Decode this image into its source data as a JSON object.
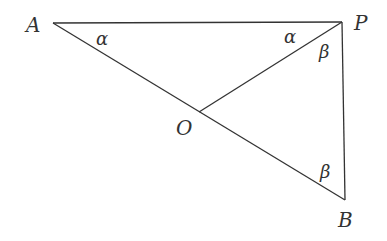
{
  "diagram": {
    "points": {
      "A": {
        "label": "A",
        "x": 53,
        "y": 23
      },
      "P": {
        "label": "P",
        "x": 342,
        "y": 22
      },
      "O": {
        "label": "O",
        "x": 199,
        "y": 112
      },
      "B": {
        "label": "B",
        "x": 345,
        "y": 200
      }
    },
    "segments": [
      {
        "from": "A",
        "to": "P"
      },
      {
        "from": "A",
        "to": "B"
      },
      {
        "from": "P",
        "to": "B"
      },
      {
        "from": "P",
        "to": "O"
      }
    ],
    "angles": [
      {
        "label": "α",
        "vertex": "A"
      },
      {
        "label": "α",
        "vertex": "P",
        "between": "PA-PO"
      },
      {
        "label": "β",
        "vertex": "P",
        "between": "PO-PB"
      },
      {
        "label": "β",
        "vertex": "B"
      }
    ]
  }
}
